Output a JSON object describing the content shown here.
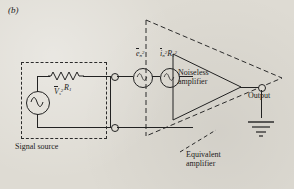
{
  "figure": {
    "panel_label": "(b)",
    "caption_blocks": {
      "signal_source": "Signal source",
      "equivalent_amplifier_line1": "Equivalent",
      "equivalent_amplifier_line2": "amplifier",
      "noiseless_amplifier_line1": "Noiseless",
      "noiseless_amplifier_line2": "amplifier",
      "output": "Output"
    }
  },
  "components": {
    "source_voltage": {
      "symbol": "V",
      "subscript": "s",
      "superscript": "2",
      "overline": true
    },
    "source_resistor": {
      "symbol": "R",
      "subscript": "1"
    },
    "noise_voltage_source": {
      "symbol": "e",
      "subscript": "n",
      "superscript": "2",
      "overline": true
    },
    "noise_current_source": {
      "symbol": "i",
      "subscript": "n",
      "superscript": "2",
      "overline": true,
      "times_symbol": "R",
      "times_subscript": "1",
      "times_superscript": "2"
    }
  },
  "icons": {
    "ac_source": "sine-wave-icon",
    "resistor": "zigzag-resistor-icon",
    "terminal": "open-circle-terminal-icon",
    "ground": "ground-icon"
  },
  "colors": {
    "ink": "#222222",
    "paper": "#dedbd3",
    "dash": "#2b2b2b"
  }
}
